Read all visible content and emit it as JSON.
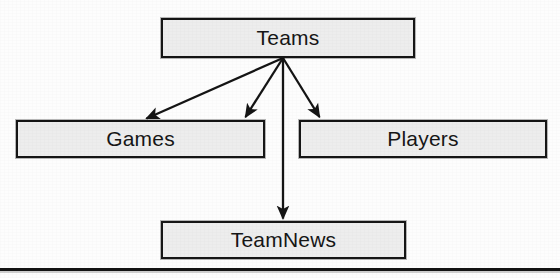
{
  "diagram": {
    "type": "node-arrow-hierarchy",
    "canvas": {
      "width": 560,
      "height": 278
    },
    "colors": {
      "box_fill": "#ededed",
      "box_border": "#151515",
      "text": "#161616",
      "arrow": "#141414",
      "background": "#fdfdfd"
    },
    "nodes": [
      {
        "id": "teams",
        "label": "Teams",
        "x": 161,
        "y": 18,
        "width": 254,
        "height": 40
      },
      {
        "id": "games",
        "label": "Games",
        "x": 16,
        "y": 120,
        "width": 249,
        "height": 38
      },
      {
        "id": "players",
        "label": "Players",
        "x": 299,
        "y": 120,
        "width": 248,
        "height": 38
      },
      {
        "id": "teamnews",
        "label": "TeamNews",
        "x": 161,
        "y": 221,
        "width": 245,
        "height": 38
      }
    ],
    "edges": [
      {
        "id": "teams-to-games",
        "from": "teams",
        "to": "games",
        "from_point": [
          283,
          58
        ],
        "to_point": [
          143,
          120
        ],
        "arrowhead": "filled-triangle"
      },
      {
        "id": "teams-to-games-alt",
        "from": "teams",
        "to": "games",
        "from_point": [
          283,
          58
        ],
        "to_point": [
          243,
          120
        ],
        "arrowhead": "filled-triangle"
      },
      {
        "id": "teams-to-players",
        "from": "teams",
        "to": "players",
        "from_point": [
          283,
          58
        ],
        "to_point": [
          322,
          120
        ],
        "arrowhead": "filled-triangle"
      },
      {
        "id": "teams-to-teamnews",
        "from": "teams",
        "to": "teamnews",
        "from_point": [
          283,
          58
        ],
        "to_point": [
          283,
          221
        ],
        "arrowhead": "filled-triangle"
      }
    ],
    "rules": [
      {
        "id": "bottom-rule",
        "x": 0,
        "y": 268,
        "width": 560,
        "height": 3
      }
    ]
  }
}
